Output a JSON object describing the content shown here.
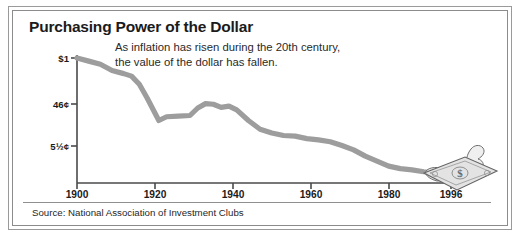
{
  "card": {
    "title": "Purchasing Power of the Dollar",
    "subtitle_line1": "As inflation has risen during the 20th century,",
    "subtitle_line2": "the value of the dollar has fallen.",
    "source": "Source: National Association of Investment Clubs",
    "border_color": "#8c8c8c",
    "background": "#ffffff"
  },
  "chart_data": {
    "type": "line",
    "title": "Purchasing Power of the Dollar",
    "subtitle": "As inflation has risen during the 20th century, the value of the dollar has fallen.",
    "xlabel": "",
    "ylabel": "",
    "grid": false,
    "legend": null,
    "line_color": "#9d9d9d",
    "axis_color": "#4a4a4a",
    "xlim": [
      1900,
      1996
    ],
    "ylim": [
      0,
      1.0
    ],
    "xticks": [
      1900,
      1920,
      1940,
      1960,
      1980,
      1996
    ],
    "xtick_labels": [
      "1900",
      "1920",
      "1940",
      "1960",
      "1980",
      "1996"
    ],
    "yticks": [
      1.0,
      0.46,
      0.055
    ],
    "ytick_labels": [
      "$1",
      "46¢",
      "5½¢"
    ],
    "x": [
      1900,
      1903,
      1906,
      1909,
      1912,
      1914,
      1916,
      1918,
      1920,
      1921,
      1923,
      1926,
      1929,
      1931,
      1933,
      1935,
      1937,
      1939,
      1941,
      1944,
      1947,
      1950,
      1953,
      1956,
      1959,
      1962,
      1965,
      1968,
      1971,
      1974,
      1977,
      1980,
      1983,
      1986,
      1989,
      1992,
      1996
    ],
    "y": [
      1.0,
      0.975,
      0.95,
      0.9,
      0.875,
      0.855,
      0.79,
      0.68,
      0.56,
      0.5,
      0.53,
      0.535,
      0.54,
      0.6,
      0.635,
      0.63,
      0.605,
      0.615,
      0.585,
      0.5,
      0.43,
      0.4,
      0.38,
      0.375,
      0.355,
      0.345,
      0.33,
      0.3,
      0.265,
      0.215,
      0.175,
      0.135,
      0.115,
      0.105,
      0.09,
      0.08,
      0.07
    ],
    "annotation": "torn-dollar-bill illustration at end of series"
  },
  "icons": {
    "dollar_bill": "torn-dollar-bill-icon"
  }
}
